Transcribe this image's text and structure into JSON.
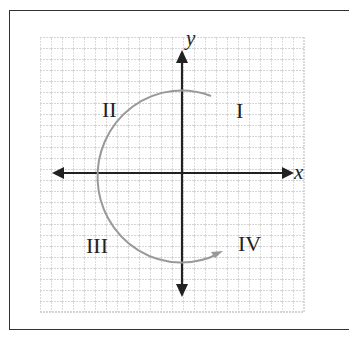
{
  "diagram": {
    "type": "coordinate-plane",
    "axes": {
      "x_label": "x",
      "y_label": "y"
    },
    "quadrants": [
      {
        "id": "I",
        "label": "I"
      },
      {
        "id": "II",
        "label": "II"
      },
      {
        "id": "III",
        "label": "III"
      },
      {
        "id": "IV",
        "label": "IV"
      }
    ],
    "arc": {
      "description": "Counterclockwise arc from quadrant I through II and III ending with arrow in quadrant IV",
      "color": "#999999"
    },
    "colors": {
      "grid": "#c8c8c8",
      "axis": "#222222",
      "frame": "#333333"
    }
  }
}
